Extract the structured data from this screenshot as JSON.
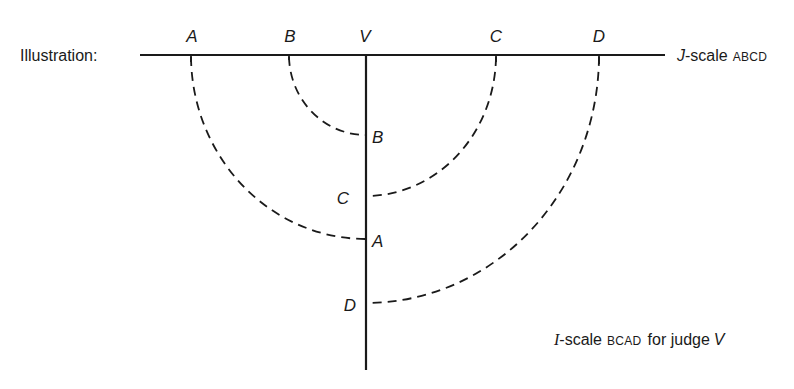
{
  "diagram": {
    "heading": "Illustration:",
    "j_scale": {
      "prefix": "J",
      "suffix": "-scale",
      "order": "ABCD",
      "points": [
        {
          "label": "A",
          "kind": "stimulus"
        },
        {
          "label": "B",
          "kind": "stimulus"
        },
        {
          "label": "V",
          "kind": "judge"
        },
        {
          "label": "C",
          "kind": "stimulus"
        },
        {
          "label": "D",
          "kind": "stimulus"
        }
      ]
    },
    "i_scale": {
      "prefix": "I",
      "suffix": "-scale",
      "order": "BCAD",
      "for_text": "for judge",
      "judge": "V",
      "points": [
        {
          "label": "B"
        },
        {
          "label": "C"
        },
        {
          "label": "A"
        },
        {
          "label": "D"
        }
      ]
    },
    "folds": [
      {
        "from": "A",
        "to": "A"
      },
      {
        "from": "B",
        "to": "B"
      },
      {
        "from": "C",
        "to": "C"
      },
      {
        "from": "D",
        "to": "D"
      }
    ]
  }
}
